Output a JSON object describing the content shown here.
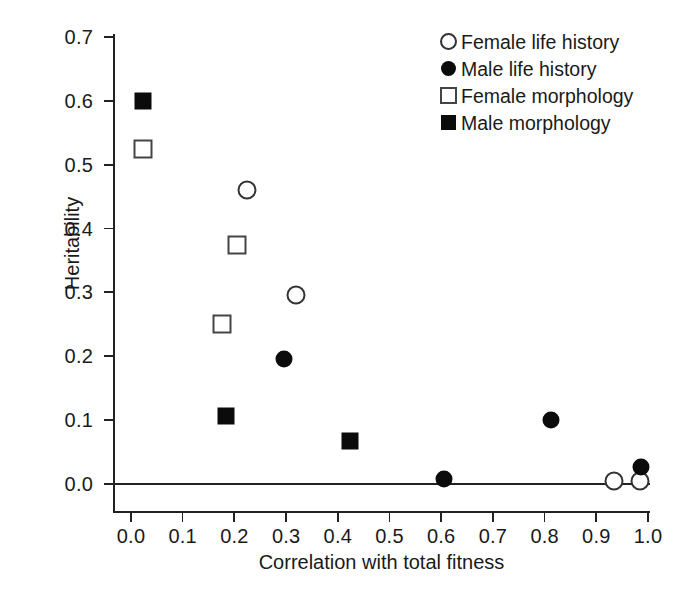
{
  "chart_data": {
    "type": "scatter",
    "title": "",
    "xlabel": "Correlation with total fitness",
    "ylabel": "Heritability",
    "xlim": [
      0.0,
      1.0
    ],
    "ylim": [
      0.0,
      0.7
    ],
    "xticks": [
      "0.0",
      "0.1",
      "0.2",
      "0.3",
      "0.4",
      "0.5",
      "0.6",
      "0.7",
      "0.8",
      "0.9",
      "1.0"
    ],
    "yticks": [
      "0.0",
      "0.1",
      "0.2",
      "0.3",
      "0.4",
      "0.5",
      "0.6",
      "0.7"
    ],
    "xtick_values": [
      0.0,
      0.1,
      0.2,
      0.3,
      0.4,
      0.5,
      0.6,
      0.7,
      0.8,
      0.9,
      1.0
    ],
    "ytick_values": [
      0.0,
      0.1,
      0.2,
      0.3,
      0.4,
      0.5,
      0.6,
      0.7
    ],
    "grid": false,
    "legend_position": "top-right",
    "annotations": [
      "horizontal reference line drawn at Heritability = 0.0"
    ],
    "series": [
      {
        "name": "Female life history",
        "marker": "circle-open",
        "color": "#ffffff",
        "edge_color": "#333333",
        "points": [
          {
            "x": 0.224,
            "y": 0.461
          },
          {
            "x": 0.319,
            "y": 0.296
          },
          {
            "x": 0.934,
            "y": 0.005
          },
          {
            "x": 0.984,
            "y": 0.004
          }
        ]
      },
      {
        "name": "Male life history",
        "marker": "circle-filled",
        "color": "#0b0b0b",
        "edge_color": "#0b0b0b",
        "points": [
          {
            "x": 0.296,
            "y": 0.196
          },
          {
            "x": 0.605,
            "y": 0.008
          },
          {
            "x": 0.812,
            "y": 0.1
          },
          {
            "x": 0.986,
            "y": 0.027
          }
        ]
      },
      {
        "name": "Female morphology",
        "marker": "square-open",
        "color": "#ffffff",
        "edge_color": "#444444",
        "points": [
          {
            "x": 0.023,
            "y": 0.524
          },
          {
            "x": 0.205,
            "y": 0.375
          },
          {
            "x": 0.176,
            "y": 0.25
          }
        ]
      },
      {
        "name": "Male morphology",
        "marker": "square-filled",
        "color": "#0b0b0b",
        "edge_color": "#0b0b0b",
        "points": [
          {
            "x": 0.023,
            "y": 0.6
          },
          {
            "x": 0.184,
            "y": 0.106
          },
          {
            "x": 0.424,
            "y": 0.067
          }
        ]
      }
    ]
  },
  "legend": {
    "items": [
      {
        "label": "Female life history",
        "key": "circle-open-icon"
      },
      {
        "label": "Male life history",
        "key": "circle-filled-icon"
      },
      {
        "label": "Female morphology",
        "key": "square-open-icon"
      },
      {
        "label": "Male morphology",
        "key": "square-filled-icon"
      }
    ]
  }
}
